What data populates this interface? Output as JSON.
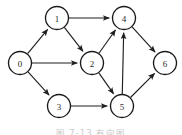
{
  "figure": {
    "caption": "图 7-13  有向图",
    "background_color": "#ffffff",
    "node_stroke_color": "#1a1a1a",
    "node_fill_color": "#ffffff",
    "edge_color": "#1f1f1f",
    "label_color": "#2a2a2a"
  },
  "graph": {
    "type": "directed-graph",
    "node_radius": 11.5,
    "nodes": [
      {
        "id": "0",
        "label": "0",
        "x": 20,
        "y": 63
      },
      {
        "id": "1",
        "label": "1",
        "x": 57,
        "y": 18
      },
      {
        "id": "2",
        "label": "2",
        "x": 92,
        "y": 63
      },
      {
        "id": "3",
        "label": "3",
        "x": 59,
        "y": 106
      },
      {
        "id": "4",
        "label": "4",
        "x": 124,
        "y": 18
      },
      {
        "id": "5",
        "label": "5",
        "x": 122,
        "y": 106
      },
      {
        "id": "6",
        "label": "6",
        "x": 165,
        "y": 63
      }
    ],
    "edges": [
      {
        "from": "0",
        "to": "1",
        "directed": true
      },
      {
        "from": "0",
        "to": "2",
        "directed": true
      },
      {
        "from": "0",
        "to": "3",
        "directed": true
      },
      {
        "from": "1",
        "to": "2",
        "directed": true
      },
      {
        "from": "1",
        "to": "4",
        "directed": true
      },
      {
        "from": "2",
        "to": "4",
        "directed": true
      },
      {
        "from": "2",
        "to": "5",
        "directed": true
      },
      {
        "from": "3",
        "to": "5",
        "directed": true
      },
      {
        "from": "5",
        "to": "4",
        "directed": true
      },
      {
        "from": "4",
        "to": "6",
        "directed": true
      },
      {
        "from": "5",
        "to": "6",
        "directed": true
      }
    ]
  }
}
